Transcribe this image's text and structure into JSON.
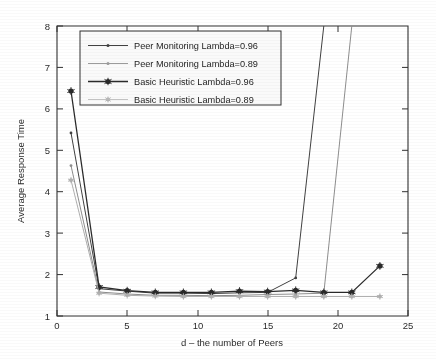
{
  "chart_data": {
    "type": "line",
    "title": "",
    "xlabel": "d – the number of Peers",
    "ylabel": "Average Response Time",
    "xlim": [
      0,
      25
    ],
    "ylim": [
      1,
      8
    ],
    "xticks": [
      0,
      5,
      10,
      15,
      20,
      25
    ],
    "yticks": [
      1,
      2,
      3,
      4,
      5,
      6,
      7,
      8
    ],
    "xtick_labels": [
      "0",
      "5",
      "10",
      "15",
      "20",
      "25"
    ],
    "ytick_labels": [
      "1",
      "2",
      "3",
      "4",
      "5",
      "6",
      "7",
      "8"
    ],
    "grid": false,
    "legend_position": "upper-left-inside",
    "x": [
      1,
      3,
      5,
      7,
      9,
      11,
      13,
      15,
      17,
      19,
      21,
      23
    ],
    "series": [
      {
        "name": "Peer Monitoring Lambda=0.96",
        "color": "#3a3a3a",
        "linestyle": "solid",
        "marker": "point",
        "values": [
          5.42,
          1.66,
          1.6,
          1.55,
          1.55,
          1.54,
          1.56,
          1.57,
          1.92,
          8.0,
          null,
          null
        ],
        "note": "diverges vertically to top of axis at d=17"
      },
      {
        "name": "Peer Monitoring Lambda=0.89",
        "color": "#8c8c8c",
        "linestyle": "solid",
        "marker": "point",
        "values": [
          4.63,
          1.58,
          1.53,
          1.5,
          1.5,
          1.49,
          1.5,
          1.52,
          1.53,
          1.55,
          8.0,
          null
        ],
        "note": "diverges vertically to top of axis at d=19"
      },
      {
        "name": "Basic Heuristic Lambda=0.96",
        "color": "#232323",
        "linestyle": "solid",
        "marker": "star",
        "values": [
          6.43,
          1.7,
          1.61,
          1.57,
          1.57,
          1.57,
          1.6,
          1.59,
          1.62,
          1.57,
          1.57,
          2.21
        ]
      },
      {
        "name": "Basic Heuristic Lambda=0.89",
        "color": "#b0b0b0",
        "linestyle": "solid",
        "marker": "star",
        "values": [
          4.28,
          1.55,
          1.5,
          1.48,
          1.47,
          1.47,
          1.47,
          1.47,
          1.47,
          1.47,
          1.47,
          1.47
        ]
      }
    ]
  },
  "legend": {
    "entries": [
      "Peer Monitoring Lambda=0.96",
      "Peer Monitoring Lambda=0.89",
      "Basic Heuristic Lambda=0.96",
      "Basic Heuristic Lambda=0.89"
    ]
  }
}
